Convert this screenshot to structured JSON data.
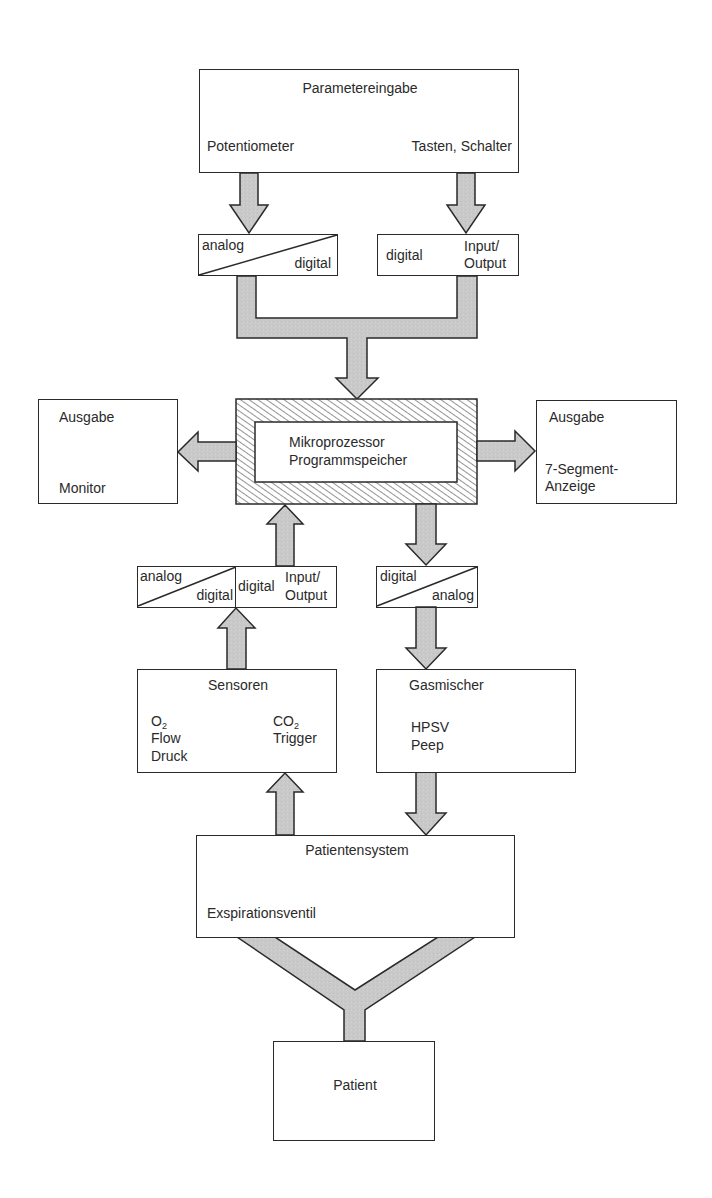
{
  "colors": {
    "line": "#2a2a2a",
    "arrow_fill": "#c8c8c8",
    "background": "#ffffff",
    "hatch": "#2a2a2a"
  },
  "nodes": {
    "parametereingabe": {
      "title": "Parametereingabe",
      "left_label": "Potentiometer",
      "right_label": "Tasten, Schalter"
    },
    "ad_converter_top": {
      "top_left": "analog",
      "bottom_right": "digital"
    },
    "io_top": {
      "left": "digital",
      "right_line1": "Input/",
      "right_line2": "Output"
    },
    "mikroprozessor": {
      "line1": "Mikroprozessor",
      "line2": "Programmspeicher"
    },
    "ausgabe_monitor": {
      "title": "Ausgabe",
      "label": "Monitor"
    },
    "ausgabe_segment": {
      "title": "Ausgabe",
      "label_line1": "7-Segment-",
      "label_line2": "Anzeige"
    },
    "ad_converter_bottom": {
      "top_left": "analog",
      "bottom_right": "digital"
    },
    "io_bottom": {
      "left": "digital",
      "right_line1": "Input/",
      "right_line2": "Output"
    },
    "da_converter": {
      "top_left": "digital",
      "bottom_right": "analog"
    },
    "sensoren": {
      "title": "Sensoren",
      "left_items": [
        "O",
        "Flow",
        "Druck"
      ],
      "o2_sub": "2",
      "right_items": [
        "CO",
        "Trigger"
      ],
      "co2_sub": "2"
    },
    "gasmischer": {
      "title": "Gasmischer",
      "items": [
        "HPSV",
        "Peep"
      ]
    },
    "patientensystem": {
      "title": "Patientensystem",
      "label": "Exspirationsventil"
    },
    "patient": {
      "title": "Patient"
    }
  },
  "edges": [
    {
      "from": "Potentiometer",
      "to": "analog/digital (oben)"
    },
    {
      "from": "Tasten, Schalter",
      "to": "digital Input/Output (oben)"
    },
    {
      "from": "analog/digital + Input/Output (oben)",
      "to": "Mikroprozessor"
    },
    {
      "from": "Mikroprozessor",
      "to": "Ausgabe Monitor"
    },
    {
      "from": "Mikroprozessor",
      "to": "Ausgabe 7-Segment-Anzeige"
    },
    {
      "from": "digital Input/Output (unten)",
      "to": "Mikroprozessor"
    },
    {
      "from": "Mikroprozessor",
      "to": "digital/analog"
    },
    {
      "from": "Sensoren",
      "to": "analog/digital (unten)"
    },
    {
      "from": "digital/analog",
      "to": "Gasmischer"
    },
    {
      "from": "Patientensystem",
      "to": "Sensoren"
    },
    {
      "from": "Gasmischer",
      "to": "Patientensystem"
    },
    {
      "from": "Patientensystem",
      "to": "Patient",
      "type": "Y-connector"
    }
  ]
}
